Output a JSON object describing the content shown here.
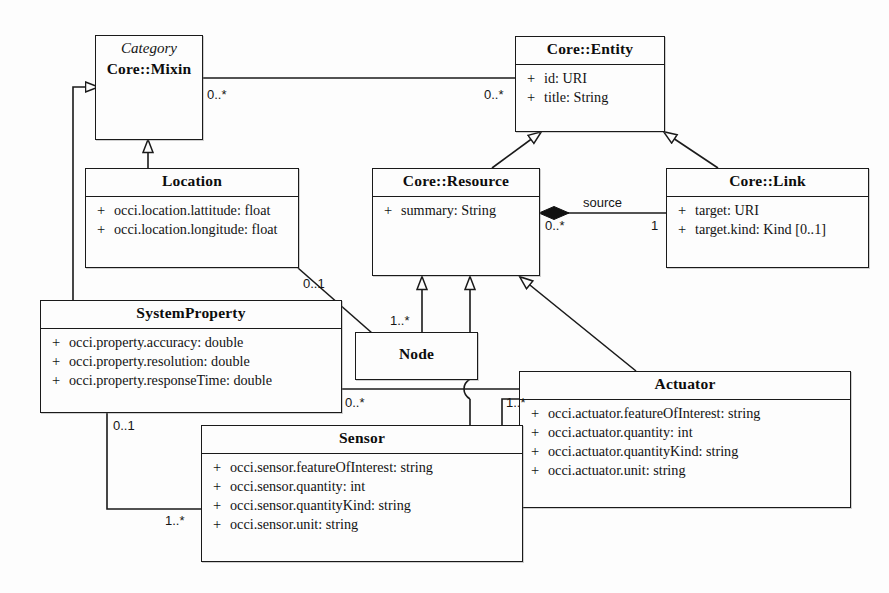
{
  "diagram": {
    "kind": "uml-class-diagram",
    "background": "#fdfdfd",
    "line_color": "#1a1a1a"
  },
  "classes": {
    "mixin": {
      "stereotype": "Category",
      "name": "Core::Mixin",
      "attributes": []
    },
    "entity": {
      "name": "Core::Entity",
      "attributes": [
        {
          "visibility": "+",
          "text": "id: URI"
        },
        {
          "visibility": "+",
          "text": "title: String"
        }
      ]
    },
    "location": {
      "name": "Location",
      "attributes": [
        {
          "visibility": "+",
          "text": "occi.location.lattitude: float"
        },
        {
          "visibility": "+",
          "text": "occi.location.longitude: float"
        }
      ]
    },
    "resource": {
      "name": "Core::Resource",
      "attributes": [
        {
          "visibility": "+",
          "text": "summary: String"
        }
      ]
    },
    "link": {
      "name": "Core::Link",
      "attributes": [
        {
          "visibility": "+",
          "text": "target: URI"
        },
        {
          "visibility": "+",
          "text": "target.kind: Kind [0..1]"
        }
      ]
    },
    "systemproperty": {
      "name": "SystemProperty",
      "attributes": [
        {
          "visibility": "+",
          "text": "occi.property.accuracy: double"
        },
        {
          "visibility": "+",
          "text": "occi.property.resolution: double"
        },
        {
          "visibility": "+",
          "text": "occi.property.responseTime: double"
        }
      ]
    },
    "node": {
      "name": "Node",
      "attributes": []
    },
    "actuator": {
      "name": "Actuator",
      "attributes": [
        {
          "visibility": "+",
          "text": "occi.actuator.featureOfInterest: string"
        },
        {
          "visibility": "+",
          "text": "occi.actuator.quantity: int"
        },
        {
          "visibility": "+",
          "text": "occi.actuator.quantityKind: string"
        },
        {
          "visibility": "+",
          "text": "occi.actuator.unit: string"
        }
      ]
    },
    "sensor": {
      "name": "Sensor",
      "attributes": [
        {
          "visibility": "+",
          "text": "occi.sensor.featureOfInterest: string"
        },
        {
          "visibility": "+",
          "text": "occi.sensor.quantity: int"
        },
        {
          "visibility": "+",
          "text": "occi.sensor.quantityKind: string"
        },
        {
          "visibility": "+",
          "text": "occi.sensor.unit: string"
        }
      ]
    }
  },
  "labels": {
    "mixin_entity_left": "0..*",
    "mixin_entity_right": "0..*",
    "resource_link_role": "source",
    "resource_link_source_mult": "0..*",
    "resource_link_target_mult": "1",
    "location_node_mult": "0..1",
    "node_location_mult": "1..*",
    "systemproperty_actuator_mult": "0..*",
    "actuator_systemproperty_mult": "1..*",
    "systemproperty_sensor_mult": "0..1",
    "sensor_systemproperty_mult": "1..*"
  }
}
